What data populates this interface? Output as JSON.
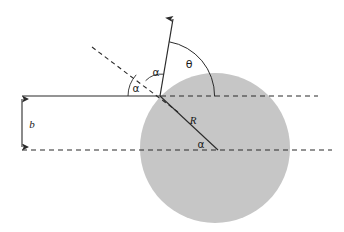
{
  "figure": {
    "type": "scattering-geometry-diagram",
    "title": "",
    "background_color": "#ffffff",
    "width": 344,
    "height": 232
  },
  "colors": {
    "sphere_fill": "#c6c6c6",
    "line": "#2b2b2b",
    "dashed": "#2b2b2b",
    "text": "#1a1a1a"
  },
  "sphere": {
    "name": "hard-sphere-target",
    "cx": 215,
    "cy": 148,
    "r": 75,
    "fill": "#c6c6c6"
  },
  "points": {
    "impact_point": {
      "x": 160,
      "y": 96
    },
    "sphere_center": {
      "x": 215,
      "y": 148
    },
    "radius_end": {
      "x": 218,
      "y": 150
    },
    "arrow_tip": {
      "x": 173,
      "y": 14
    },
    "normal_start": {
      "x": 92,
      "y": 47
    },
    "incoming_start": {
      "x": 22,
      "y": 96
    },
    "upper_dash_end": {
      "x": 318,
      "y": 96
    },
    "lower_dash_start": {
      "x": 22,
      "y": 150
    },
    "lower_dash_end": {
      "x": 332,
      "y": 150
    }
  },
  "lines": {
    "incoming_trajectory": {
      "label": "incoming-particle-trajectory",
      "style": "solid",
      "y": 96
    },
    "incoming_extension": {
      "label": "trajectory-extension",
      "style": "dashed",
      "y": 96
    },
    "center_axis": {
      "label": "center-horizontal-axis",
      "style": "dashed",
      "y": 150
    },
    "normal": {
      "label": "surface-normal-dashed",
      "style": "dashed"
    },
    "radius": {
      "label": "radius-line",
      "style": "solid"
    },
    "outgoing": {
      "label": "outgoing-scattered-ray",
      "style": "solid-with-arrowhead"
    }
  },
  "labels": {
    "impact_parameter": {
      "text": "b",
      "x": 32,
      "y": 128,
      "font_size": 11,
      "style": "italic"
    },
    "radius": {
      "text": "R",
      "x": 193,
      "y": 124,
      "font_size": 11,
      "style": "italic"
    },
    "theta": {
      "text": "θ",
      "x": 189,
      "y": 68,
      "font_size": 11,
      "style": "greek"
    },
    "alpha_incidence": {
      "text": "α",
      "x": 136,
      "y": 92,
      "font_size": 10,
      "style": "greek"
    },
    "alpha_reflection": {
      "text": "α",
      "x": 156,
      "y": 76,
      "font_size": 10,
      "style": "greek"
    },
    "alpha_center": {
      "text": "α",
      "x": 201,
      "y": 148,
      "font_size": 10,
      "style": "greek"
    }
  },
  "dimension_arrow": {
    "name": "impact-parameter-dimension",
    "x": 22,
    "y_top": 96,
    "y_bottom": 150,
    "double_headed": true
  },
  "arcs": {
    "theta_arc": {
      "name": "theta-angle-arc",
      "center": {
        "x": 160,
        "y": 96
      },
      "radius": 55,
      "from": "outgoing-ray",
      "to": "horizontal-dashed"
    }
  }
}
